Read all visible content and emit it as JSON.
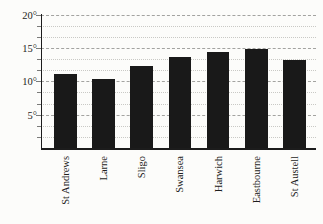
{
  "chart_data": {
    "type": "bar",
    "title": "",
    "categories": [
      "St Andrews",
      "Larne",
      "Sligo",
      "Swansea",
      "Harwich",
      "Eastbourne",
      "St Austell"
    ],
    "values": [
      11.2,
      10.4,
      12.3,
      13.7,
      14.4,
      14.9,
      13.3
    ],
    "unit": "°",
    "xlabel": "",
    "ylabel": "",
    "ylim": [
      0,
      20
    ],
    "yticks": [
      {
        "value": 20,
        "label": "20°"
      },
      {
        "value": 15,
        "label": "15°"
      },
      {
        "value": 10,
        "label": "10°"
      },
      {
        "value": 5,
        "label": "5°"
      }
    ],
    "minor_divisions_per_major": 3,
    "grid": true,
    "legend_position": "none",
    "bar_color": "#191919",
    "axis_color": "#1c1c1c",
    "tick_color": "#7a7a78",
    "gridline_major_color": "#a3a3a0",
    "gridline_minor_color": "#c9c9c5",
    "text_color": "#1e1e1c",
    "background": "#fcfcfa"
  }
}
